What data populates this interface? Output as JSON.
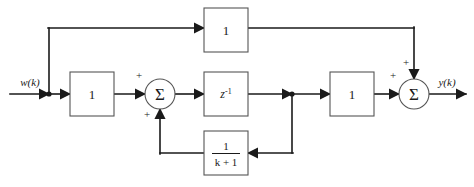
{
  "diagram": {
    "type": "signal-flow-block-diagram",
    "stroke_color": "#1a1a1a",
    "block_fill": "#ffffff",
    "background": "#ffffff",
    "signals": {
      "input_label": "w(k)",
      "output_label": "y(k)"
    },
    "blocks": [
      {
        "id": "top_gain",
        "label": "1",
        "x": 204,
        "y": 8,
        "w": 44,
        "h": 44
      },
      {
        "id": "input_gain",
        "label": "1",
        "x": 70,
        "y": 72,
        "w": 44,
        "h": 44
      },
      {
        "id": "delay",
        "label": "z^-1",
        "base": "z",
        "exponent": "-1",
        "x": 204,
        "y": 72,
        "w": 44,
        "h": 44
      },
      {
        "id": "output_gain",
        "label": "1",
        "x": 330,
        "y": 72,
        "w": 44,
        "h": 44
      },
      {
        "id": "feedback_gain",
        "numerator": "1",
        "denominator": "k + 1",
        "x": 204,
        "y": 131,
        "w": 44,
        "h": 44
      }
    ],
    "summers": [
      {
        "id": "sum_left",
        "glyph": "Σ",
        "cx": 160,
        "cy": 94,
        "r": 15,
        "signs": [
          {
            "text": "+",
            "x": 139,
            "y": 79
          },
          {
            "text": "+",
            "x": 146,
            "y": 117
          }
        ]
      },
      {
        "id": "sum_right",
        "glyph": "Σ",
        "cx": 414,
        "cy": 94,
        "r": 15,
        "signs": [
          {
            "text": "+",
            "x": 393,
            "y": 79
          },
          {
            "text": "+",
            "x": 408,
            "y": 63
          }
        ]
      }
    ],
    "junctions": [
      {
        "id": "input_branch_node",
        "cx": 49,
        "cy": 94
      },
      {
        "id": "delay_out_node",
        "cx": 292,
        "cy": 94
      }
    ]
  }
}
